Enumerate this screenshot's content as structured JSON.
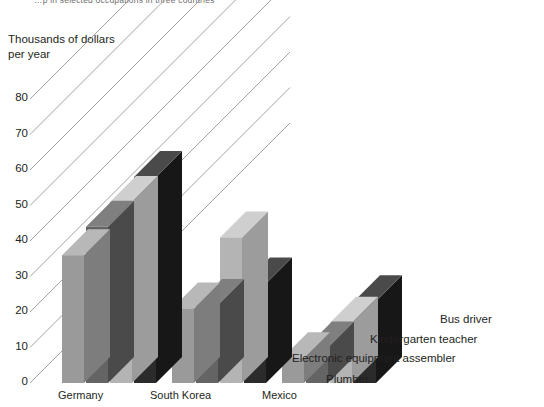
{
  "title": {
    "text": "…p in selected occupations in three countries",
    "note": "clipped at top edge"
  },
  "axis_caption": "Thousands of dollars\nper year",
  "yticks": [
    "0",
    "10",
    "20",
    "30",
    "40",
    "50",
    "60",
    "70",
    "80"
  ],
  "xlabels": [
    "Germany",
    "South Korea",
    "Mexico"
  ],
  "legend": [
    {
      "label": "Plumber",
      "color": "#9a9a9a"
    },
    {
      "label": "Electronic equipment assembler",
      "color": "#646464"
    },
    {
      "label": "Kindergarten teacher",
      "color": "#b4b4b4"
    },
    {
      "label": "Bus driver",
      "color": "#2b2b2b"
    }
  ],
  "colors": {
    "series1_face": "#9a9a9a",
    "series1_top": "#b8b8b8",
    "series1_side": "#7d7d7d",
    "series2_face": "#646464",
    "series2_top": "#7f7f7f",
    "series2_side": "#4a4a4a",
    "series3_face": "#b4b4b4",
    "series3_top": "#cfcfcf",
    "series3_side": "#9c9c9c",
    "series4_face": "#2b2b2b",
    "series4_top": "#4a4a4a",
    "series4_side": "#171717",
    "gridline": "#8a8a8a",
    "background": "#ffffff",
    "text": "#231f20"
  },
  "chart_data": {
    "type": "bar",
    "title": "…p in selected occupations in three countries",
    "xlabel": "",
    "ylabel": "Thousands of dollars per year",
    "ylim": [
      0,
      80
    ],
    "ytick_step": 10,
    "grid": true,
    "grid_style": "3d-depth-diagonals",
    "legend_position": "right-staircase",
    "categories": [
      "Germany",
      "South Korea",
      "Mexico"
    ],
    "series": [
      {
        "name": "Plumber",
        "color": "#9a9a9a",
        "values": [
          36,
          21,
          7
        ]
      },
      {
        "name": "Electronic equipment assembler",
        "color": "#646464",
        "values": [
          44,
          22,
          10
        ]
      },
      {
        "name": "Kindergarten teacher",
        "color": "#b4b4b4",
        "values": [
          51,
          41,
          17
        ]
      },
      {
        "name": "Bus driver",
        "color": "#2b2b2b",
        "values": [
          58,
          28,
          23
        ]
      }
    ]
  }
}
